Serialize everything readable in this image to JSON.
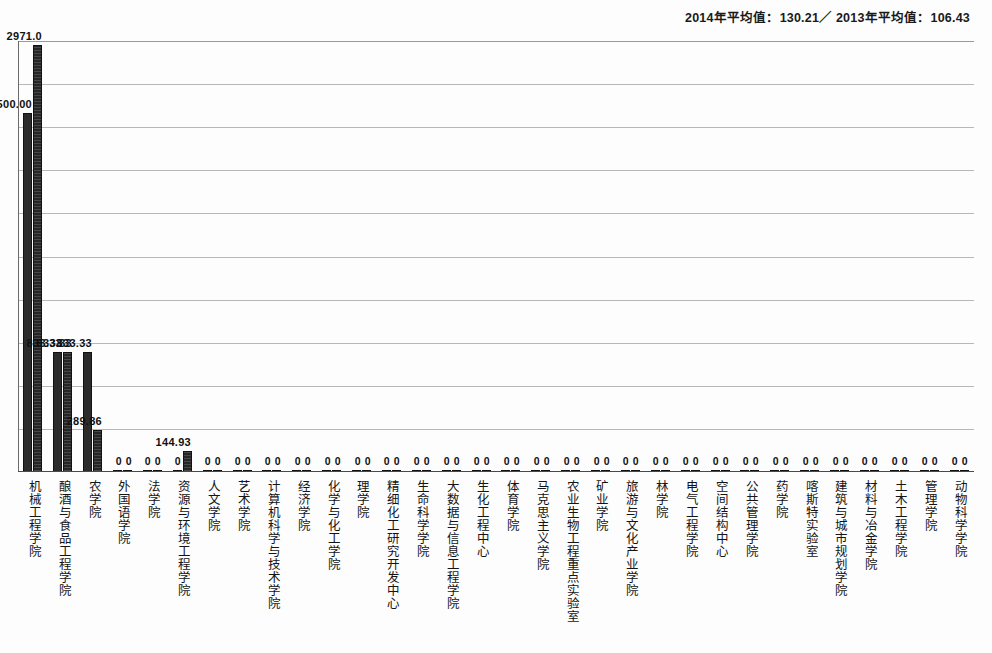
{
  "header": {
    "note": "2014年平均值：130.21／ 2013年平均值：106.43"
  },
  "chart_data": {
    "type": "bar",
    "title": "",
    "xlabel": "",
    "ylabel": "",
    "ylim": [
      0,
      3000
    ],
    "grid": true,
    "gridline_step": 300,
    "gridline_count": 10,
    "legend_position": "none",
    "annotations": [
      "2014年平均值：130.21／ 2013年平均值：106.43"
    ],
    "categories": [
      "机械工程学院",
      "酿酒与食品工程学院",
      "农学院",
      "外国语学院",
      "法学院",
      "资源与环境工程学院",
      "人文学院",
      "艺术学院",
      "计算机科学与技术学院",
      "经济学院",
      "化学与化工学院",
      "理学院",
      "精细化工研究开发中心",
      "生命科学学院",
      "大数据与信息工程学院",
      "生化工程中心",
      "体育学院",
      "马克思主义学院",
      "农业生物工程重点实验室",
      "矿业学院",
      "旅游与文化产业学院",
      "林学院",
      "电气工程学院",
      "空间结构中心",
      "公共管理学院",
      "药学院",
      "喀斯特实验室",
      "建筑与城市规划学院",
      "材料与冶金学院",
      "土木工程学院",
      "管理学院",
      "动物科学学院"
    ],
    "series": [
      {
        "name": "2013",
        "values": [
          2500.0,
          833.33,
          833.33,
          0,
          0,
          0,
          0,
          0,
          0,
          0,
          0,
          0,
          0,
          0,
          0,
          0,
          0,
          0,
          0,
          0,
          0,
          0,
          0,
          0,
          0,
          0,
          0,
          0,
          0,
          0,
          0,
          0
        ],
        "labels": [
          "2500.00",
          "833.33",
          "833.33",
          "0",
          "0",
          "0",
          "0",
          "0",
          "0",
          "0",
          "0",
          "0",
          "0",
          "0",
          "0",
          "0",
          "0",
          "0",
          "0",
          "0",
          "0",
          "0",
          "0",
          "0",
          "0",
          "0",
          "0",
          "0",
          "0",
          "0",
          "0",
          "0"
        ]
      },
      {
        "name": "2014",
        "values": [
          2971.0,
          833.33,
          289.86,
          0,
          0,
          144.93,
          0,
          0,
          0,
          0,
          0,
          0,
          0,
          0,
          0,
          0,
          0,
          0,
          0,
          0,
          0,
          0,
          0,
          0,
          0,
          0,
          0,
          0,
          0,
          0,
          0,
          0
        ],
        "labels": [
          "2971.0",
          "833.33",
          "289.86",
          "0",
          "0",
          "144.93",
          "0",
          "0",
          "0",
          "0",
          "0",
          "0",
          "0",
          "0",
          "0",
          "0",
          "0",
          "0",
          "0",
          "0",
          "0",
          "0",
          "0",
          "0",
          "0",
          "0",
          "0",
          "0",
          "0",
          "0",
          "0",
          "0"
        ]
      }
    ]
  }
}
